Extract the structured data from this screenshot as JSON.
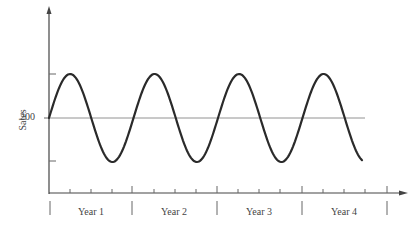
{
  "chart_data": {
    "type": "line",
    "title": "",
    "xlabel": "",
    "ylabel": "Sales",
    "y_tick_labels": [
      "200"
    ],
    "categories": [
      "Year 1",
      "Year 2",
      "Year 3",
      "Year 4"
    ],
    "grid": false,
    "legend": null,
    "series": [
      {
        "name": "Sales",
        "baseline": 200,
        "amplitude_relative": 1,
        "cycles_per_year": 1,
        "x_years": [
          0,
          0.25,
          0.5,
          0.75,
          1.0,
          1.25,
          1.5,
          1.75,
          2.0,
          2.25,
          2.5,
          2.75,
          3.0,
          3.25,
          3.5,
          3.75,
          4.0
        ],
        "values_relative": [
          0,
          1,
          0,
          -1,
          0,
          1,
          0,
          -1,
          0,
          1,
          0,
          -1,
          0,
          1,
          0,
          -1,
          -0.7
        ]
      }
    ],
    "reference_line": {
      "value": 200,
      "style": "thin horizontal"
    }
  },
  "axis": {
    "ylabel": "Sales",
    "ytick": "200"
  },
  "years": [
    "Year 1",
    "Year 2",
    "Year 3",
    "Year 4"
  ],
  "colors": {
    "line": "#2a2a2a",
    "axis": "#444444",
    "reference": "#777777"
  }
}
